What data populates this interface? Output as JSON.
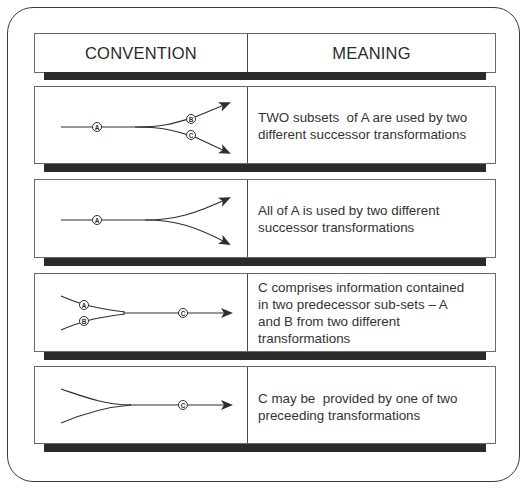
{
  "header": {
    "convention_label": "CONVENTION",
    "meaning_label": "MEANING"
  },
  "rows": [
    {
      "diagram": "split-subsets",
      "labels": [
        "A",
        "B",
        "C"
      ],
      "meaning_lines": [
        "TWO subsets  of A are used by two",
        "different successor transformations"
      ]
    },
    {
      "diagram": "split-all",
      "labels": [
        "A"
      ],
      "meaning_lines": [
        "All of A is used by two different",
        "successor transformations"
      ]
    },
    {
      "diagram": "merge-subsets",
      "labels": [
        "A",
        "B",
        "C"
      ],
      "meaning_lines": [
        "C comprises information contained",
        "in two predecessor sub-sets – A",
        "and B from two different",
        "transformations"
      ]
    },
    {
      "diagram": "merge-alternative",
      "labels": [
        "C"
      ],
      "meaning_lines": [
        "C may be  provided by one of two",
        "preceeding transformations"
      ]
    }
  ],
  "colors": {
    "line": "#2e2e2e",
    "shadow": "#2b2b2b",
    "border": "#6a6a6a"
  }
}
